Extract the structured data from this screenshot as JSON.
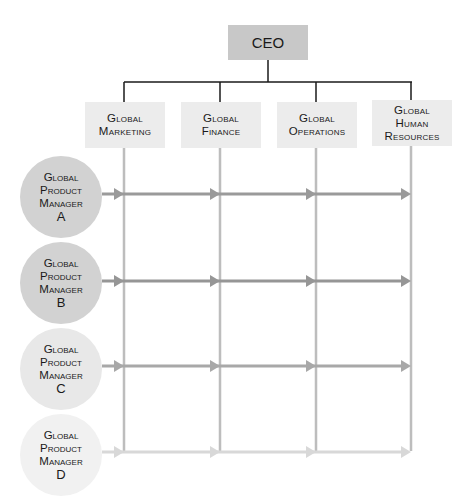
{
  "diagram": {
    "type": "matrix-organization-chart",
    "ceo": {
      "label": "CEO",
      "color": "#c8c8c8"
    },
    "departments": [
      {
        "id": "marketing",
        "lines": [
          "Global",
          "Marketing"
        ],
        "x": 124
      },
      {
        "id": "finance",
        "lines": [
          "Global",
          "Finance"
        ],
        "x": 220
      },
      {
        "id": "operations",
        "lines": [
          "Global",
          "Operations"
        ],
        "x": 316
      },
      {
        "id": "hr",
        "lines": [
          "Global",
          "Human",
          "Resources"
        ],
        "x": 411
      }
    ],
    "product_managers": [
      {
        "id": "A",
        "lines": [
          "Global",
          "Product",
          "Manager"
        ],
        "letter": "A",
        "fill": "#d2d2d2",
        "arrow_color": "#9a9a9a",
        "y": 194
      },
      {
        "id": "B",
        "lines": [
          "Global",
          "Product",
          "Manager"
        ],
        "letter": "B",
        "fill": "#d2d2d2",
        "arrow_color": "#969696",
        "y": 281
      },
      {
        "id": "C",
        "lines": [
          "Global",
          "Product",
          "Manager"
        ],
        "letter": "C",
        "fill": "#e8e8e8",
        "arrow_color": "#a8a8a8",
        "y": 366
      },
      {
        "id": "D",
        "lines": [
          "Global",
          "Product",
          "Manager"
        ],
        "letter": "D",
        "fill": "#f1f1f1",
        "arrow_color": "#d8d8d8",
        "y": 452
      }
    ],
    "colors": {
      "department_box": "#ececec",
      "vertical_line": "#bdbdbd",
      "connector": "#1a1a1a"
    }
  }
}
